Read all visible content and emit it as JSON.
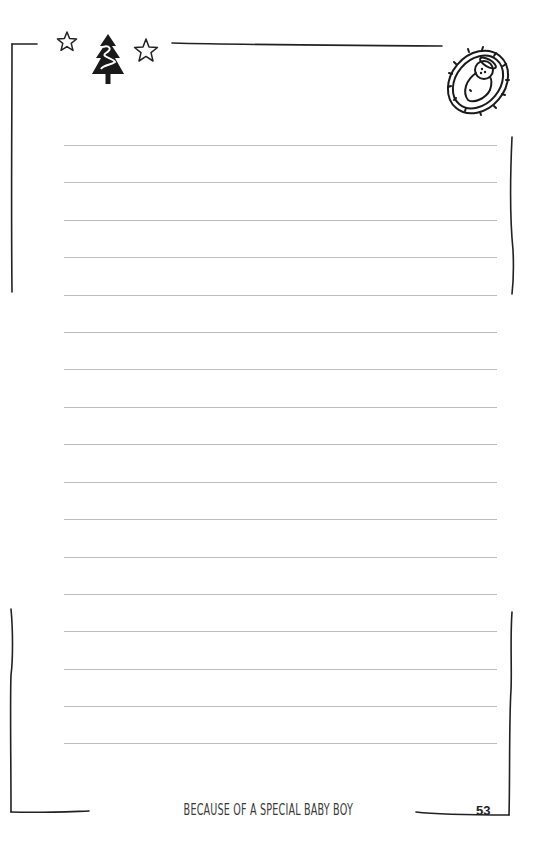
{
  "page": {
    "footer_title": "BECAUSE OF A SPECIAL BABY BOY",
    "page_number": "53",
    "ruled_line_count": 17,
    "ruled_lines_y": [
      145,
      182,
      220,
      257,
      295,
      332,
      369,
      407,
      444,
      482,
      519,
      557,
      594,
      631,
      669,
      706,
      743
    ],
    "colors": {
      "border": "#222222",
      "ruled_line": "#bdbdbd",
      "text": "#3a3a3a"
    }
  },
  "decorations": {
    "top_left": [
      "star-outline-icon",
      "christmas-tree-icon",
      "star-outline-icon"
    ],
    "top_right": "baby-jesus-manger-icon"
  }
}
